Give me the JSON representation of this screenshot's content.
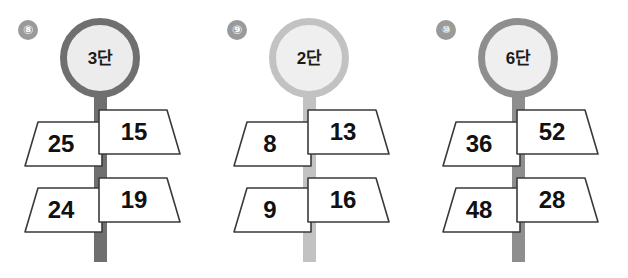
{
  "figure": {
    "background_color": "#ffffff"
  },
  "panels": [
    {
      "index_label": "⑧",
      "index_number": "8",
      "head_label": "3#38",
      "head_text": "3단",
      "ring_color": "#6f6f6f",
      "pole_color": "#6f6f6f",
      "circle_fill": "#ececec",
      "rows": [
        {
          "left": "25",
          "right": "15"
        },
        {
          "left": "24",
          "right": "19"
        }
      ]
    },
    {
      "index_label": "⑨",
      "index_number": "9",
      "head_label": "2#38",
      "head_text": "2단",
      "ring_color": "#c2c2c2",
      "pole_color": "#c2c2c2",
      "circle_fill": "#efefef",
      "rows": [
        {
          "left": "8",
          "right": "13"
        },
        {
          "left": "9",
          "right": "16"
        }
      ]
    },
    {
      "index_label": "⑩",
      "index_number": "10",
      "head_label": "6#38",
      "head_text": "6단",
      "ring_color": "#8e8e8e",
      "pole_color": "#8e8e8e",
      "circle_fill": "#efefef",
      "rows": [
        {
          "left": "36",
          "right": "52"
        },
        {
          "left": "48",
          "right": "28"
        }
      ]
    }
  ],
  "style": {
    "plate_stroke": "#3a3a3a",
    "plate_fill": "#ffffff",
    "value_color": "#111111",
    "badge_color": "#9a9a9a"
  }
}
